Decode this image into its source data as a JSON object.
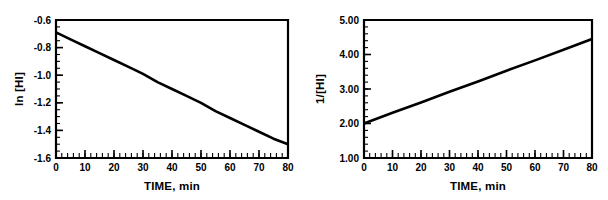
{
  "figure": {
    "background_color": "#ffffff",
    "line_color": "#000000",
    "panels": [
      "left",
      "right"
    ]
  },
  "chart_data": [
    {
      "type": "line",
      "panel": "left",
      "title": "",
      "xlabel": "TIME, min",
      "ylabel": "ln [HI]",
      "xlim": [
        0,
        80
      ],
      "ylim": [
        -1.6,
        -0.6
      ],
      "grid": false,
      "legend": null,
      "x_ticks": [
        0,
        10,
        20,
        30,
        40,
        50,
        60,
        70,
        80
      ],
      "x_tick_labels": [
        "0",
        "10",
        "20",
        "30",
        "40",
        "50",
        "60",
        "70",
        "80"
      ],
      "y_ticks": [
        -0.6,
        -0.8,
        -1.0,
        -1.2,
        -1.4,
        -1.6
      ],
      "y_tick_labels": [
        "-0.6",
        "-0.8",
        "-1.0",
        "-1.2",
        "-1.4",
        "-1.6"
      ],
      "x_minor_tick_interval": 2,
      "y_minor_tick_interval": 0.05,
      "series": [
        {
          "name": "ln [HI] vs time",
          "x": [
            0,
            5,
            10,
            15,
            20,
            25,
            30,
            35,
            40,
            45,
            50,
            55,
            60,
            65,
            70,
            75,
            80
          ],
          "y": [
            -0.69,
            -0.74,
            -0.79,
            -0.84,
            -0.89,
            -0.94,
            -0.99,
            -1.05,
            -1.1,
            -1.15,
            -1.2,
            -1.26,
            -1.31,
            -1.36,
            -1.41,
            -1.46,
            -1.5
          ]
        }
      ]
    },
    {
      "type": "line",
      "panel": "right",
      "title": "",
      "xlabel": "TIME, min",
      "ylabel": "1/[HI]",
      "xlim": [
        0,
        80
      ],
      "ylim": [
        1.0,
        5.0
      ],
      "grid": false,
      "legend": null,
      "x_ticks": [
        0,
        10,
        20,
        30,
        40,
        50,
        60,
        70,
        80
      ],
      "x_tick_labels": [
        "0",
        "10",
        "20",
        "30",
        "40",
        "50",
        "60",
        "70",
        "80"
      ],
      "y_ticks": [
        1.0,
        2.0,
        3.0,
        4.0,
        5.0
      ],
      "y_tick_labels": [
        "1.00",
        "2.00",
        "3.00",
        "4.00",
        "5.00"
      ],
      "x_minor_tick_interval": 2,
      "y_minor_tick_interval": 0.2,
      "series": [
        {
          "name": "1/[HI] vs time",
          "x": [
            0,
            10,
            20,
            30,
            40,
            50,
            60,
            70,
            80
          ],
          "y": [
            2.0,
            2.31,
            2.61,
            2.92,
            3.22,
            3.53,
            3.83,
            4.14,
            4.45
          ]
        }
      ]
    }
  ]
}
